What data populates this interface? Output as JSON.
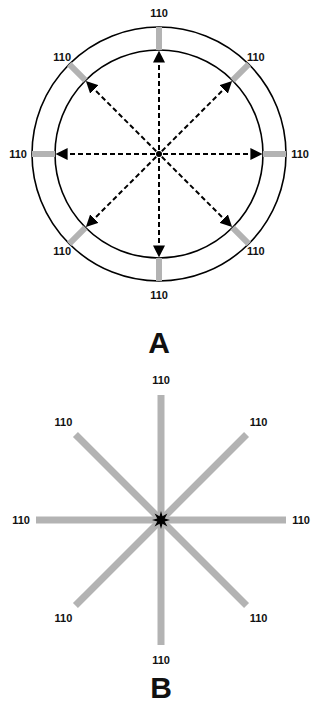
{
  "panels": [
    {
      "id": "A",
      "label": "A",
      "description": "Two concentric circles with eight dashed double-ended arrows from center to inner circle; gray ticks between circles at 45-degree intervals",
      "directions_deg": [
        90,
        45,
        0,
        315,
        270,
        225,
        180,
        135
      ],
      "values": [
        "110",
        "110",
        "110",
        "110",
        "110",
        "110",
        "110",
        "110"
      ]
    },
    {
      "id": "B",
      "label": "B",
      "description": "Eight gray spokes radiating from a black star at center at 45-degree intervals",
      "directions_deg": [
        90,
        45,
        0,
        315,
        270,
        225,
        180,
        135
      ],
      "values": [
        "110",
        "110",
        "110",
        "110",
        "110",
        "110",
        "110",
        "110"
      ]
    }
  ],
  "colors": {
    "line": "#000000",
    "spoke": "#b3b3b3",
    "text": "#111111",
    "background": "#ffffff"
  }
}
